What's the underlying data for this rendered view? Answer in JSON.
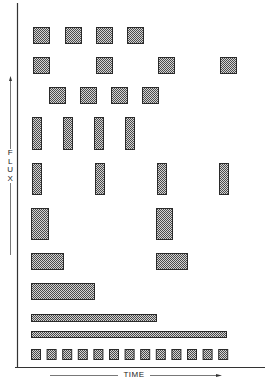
{
  "diagram": {
    "y_axis_label": "FLUX",
    "x_axis_label": "TIME",
    "colors": {
      "block_fill_dark": "#3a3a3a",
      "block_fill_light": "#cfcfcf",
      "axis": "#333333",
      "background": "#ffffff"
    },
    "rows": [
      {
        "name": "row-1",
        "y": 27,
        "h": 16,
        "blocks": [
          {
            "x": 33,
            "w": 16
          },
          {
            "x": 65,
            "w": 16
          },
          {
            "x": 96,
            "w": 16
          },
          {
            "x": 127,
            "w": 16
          }
        ]
      },
      {
        "name": "row-2",
        "y": 57,
        "h": 16,
        "blocks": [
          {
            "x": 33,
            "w": 16
          },
          {
            "x": 96,
            "w": 16
          },
          {
            "x": 158,
            "w": 16
          },
          {
            "x": 220,
            "w": 16
          }
        ]
      },
      {
        "name": "row-3",
        "y": 87,
        "h": 16,
        "blocks": [
          {
            "x": 49,
            "w": 16
          },
          {
            "x": 80,
            "w": 16
          },
          {
            "x": 111,
            "w": 16
          },
          {
            "x": 142,
            "w": 16
          }
        ]
      },
      {
        "name": "row-4",
        "y": 117,
        "h": 32,
        "blocks": [
          {
            "x": 32,
            "w": 9
          },
          {
            "x": 63,
            "w": 9
          },
          {
            "x": 94,
            "w": 9
          },
          {
            "x": 125,
            "w": 9
          }
        ]
      },
      {
        "name": "row-5",
        "y": 163,
        "h": 31,
        "blocks": [
          {
            "x": 32,
            "w": 9
          },
          {
            "x": 95,
            "w": 9
          },
          {
            "x": 157,
            "w": 9
          },
          {
            "x": 219,
            "w": 9
          }
        ]
      },
      {
        "name": "row-6",
        "y": 208,
        "h": 31,
        "blocks": [
          {
            "x": 31,
            "w": 17
          },
          {
            "x": 156,
            "w": 16
          }
        ]
      },
      {
        "name": "row-7",
        "y": 253,
        "h": 16,
        "blocks": [
          {
            "x": 31,
            "w": 32
          },
          {
            "x": 156,
            "w": 31
          }
        ]
      },
      {
        "name": "row-8",
        "y": 283,
        "h": 16,
        "blocks": [
          {
            "x": 31,
            "w": 63
          }
        ]
      },
      {
        "name": "row-9",
        "y": 314,
        "h": 7,
        "blocks": [
          {
            "x": 31,
            "w": 125
          }
        ]
      },
      {
        "name": "row-10",
        "y": 331,
        "h": 6,
        "blocks": [
          {
            "x": 31,
            "w": 195
          }
        ]
      },
      {
        "name": "row-11",
        "y": 349,
        "h": 10,
        "blocks": [
          {
            "x": 31,
            "w": 9
          },
          {
            "x": 46.6,
            "w": 9
          },
          {
            "x": 62.2,
            "w": 9
          },
          {
            "x": 77.8,
            "w": 9
          },
          {
            "x": 93.4,
            "w": 9
          },
          {
            "x": 109,
            "w": 9
          },
          {
            "x": 124.6,
            "w": 9
          },
          {
            "x": 140.2,
            "w": 9
          },
          {
            "x": 155.8,
            "w": 9
          },
          {
            "x": 171.4,
            "w": 9
          },
          {
            "x": 187,
            "w": 9
          },
          {
            "x": 202.6,
            "w": 9
          },
          {
            "x": 218.2,
            "w": 9
          }
        ]
      }
    ]
  }
}
